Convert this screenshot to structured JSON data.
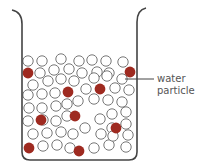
{
  "diagram": {
    "label": {
      "line1": "water",
      "line2": "particle",
      "target": [
        122,
        79
      ]
    },
    "colors": {
      "outline": "#444444",
      "water_particle_stroke": "#777777",
      "solute_particle": "#9e2a20"
    },
    "water_particles": [
      [
        28,
        61
      ],
      [
        42,
        61
      ],
      [
        61,
        59
      ],
      [
        79,
        61
      ],
      [
        92,
        60
      ],
      [
        106,
        61
      ],
      [
        123,
        62
      ],
      [
        40,
        73
      ],
      [
        54,
        70
      ],
      [
        69,
        69
      ],
      [
        82,
        73
      ],
      [
        97,
        72
      ],
      [
        109,
        73
      ],
      [
        33,
        85
      ],
      [
        48,
        81
      ],
      [
        61,
        79
      ],
      [
        74,
        81
      ],
      [
        94,
        78
      ],
      [
        107,
        76
      ],
      [
        122,
        79
      ],
      [
        28,
        95
      ],
      [
        42,
        94
      ],
      [
        55,
        93
      ],
      [
        86,
        89
      ],
      [
        115,
        88
      ],
      [
        129,
        90
      ],
      [
        29,
        108
      ],
      [
        42,
        108
      ],
      [
        56,
        106
      ],
      [
        67,
        104
      ],
      [
        78,
        101
      ],
      [
        94,
        99
      ],
      [
        108,
        100
      ],
      [
        122,
        102
      ],
      [
        28,
        121
      ],
      [
        43,
        120
      ],
      [
        56,
        121
      ],
      [
        67,
        116
      ],
      [
        100,
        119
      ],
      [
        112,
        114
      ],
      [
        126,
        112
      ],
      [
        33,
        134
      ],
      [
        47,
        133
      ],
      [
        61,
        132
      ],
      [
        73,
        134
      ],
      [
        85,
        128
      ],
      [
        101,
        134
      ],
      [
        112,
        128
      ],
      [
        126,
        124
      ],
      [
        128,
        135
      ],
      [
        43,
        146
      ],
      [
        57,
        145
      ],
      [
        70,
        148
      ],
      [
        94,
        148
      ],
      [
        109,
        145
      ],
      [
        126,
        147
      ],
      [
        113,
        136
      ]
    ],
    "solute_particles": [
      [
        28,
        73
      ],
      [
        130,
        72
      ],
      [
        68,
        92
      ],
      [
        100,
        89
      ],
      [
        41,
        120
      ],
      [
        75,
        116
      ],
      [
        116,
        128
      ],
      [
        29,
        148
      ],
      [
        79,
        151
      ]
    ]
  }
}
